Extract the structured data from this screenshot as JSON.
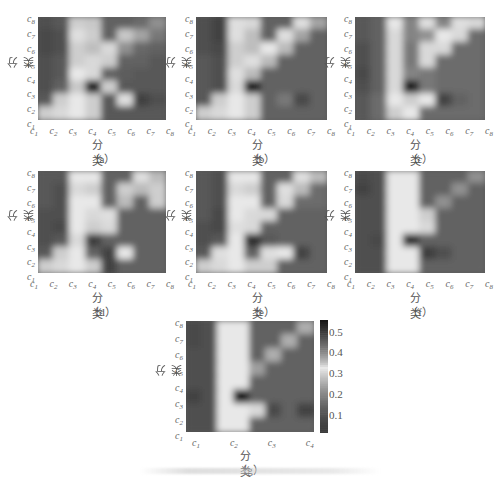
{
  "figure": {
    "axis_label": "分类",
    "colorbar": {
      "ticks": [
        "0.5",
        "0.4",
        "0.3",
        "0.2",
        "0.1"
      ],
      "tick_values": [
        0.5,
        0.4,
        0.3,
        0.2,
        0.1
      ],
      "range": [
        0.02,
        0.56
      ]
    }
  },
  "chart_data": [
    {
      "type": "heatmap",
      "panel": "a",
      "caption": "（a）",
      "xlabel": "分类",
      "ylabel": "分类",
      "x_ticks": [
        "c1",
        "c2",
        "c3",
        "c4",
        "c5",
        "c6",
        "c7",
        "c8"
      ],
      "y_ticks": [
        "c1",
        "c2",
        "c3",
        "c4",
        "c5",
        "c6",
        "c7",
        "c8"
      ],
      "values": [
        [
          0.1,
          0.12,
          0.3,
          0.35,
          0.14,
          0.14,
          0.16,
          0.4
        ],
        [
          0.08,
          0.1,
          0.32,
          0.3,
          0.14,
          0.35,
          0.38,
          0.18
        ],
        [
          0.08,
          0.1,
          0.3,
          0.28,
          0.34,
          0.4,
          0.15,
          0.14
        ],
        [
          0.1,
          0.12,
          0.3,
          0.34,
          0.3,
          0.14,
          0.14,
          0.12
        ],
        [
          0.1,
          0.12,
          0.33,
          0.34,
          0.14,
          0.13,
          0.12,
          0.12
        ],
        [
          0.1,
          0.14,
          0.35,
          0.55,
          0.3,
          0.12,
          0.12,
          0.12
        ],
        [
          0.12,
          0.3,
          0.33,
          0.3,
          0.12,
          0.32,
          0.05,
          0.1
        ],
        [
          0.3,
          0.34,
          0.33,
          0.3,
          0.12,
          0.12,
          0.12,
          0.12
        ]
      ]
    },
    {
      "type": "heatmap",
      "panel": "b",
      "caption": "（b）",
      "xlabel": "分类",
      "ylabel": "分类",
      "x_ticks": [
        "c1",
        "c2",
        "c3",
        "c4",
        "c5",
        "c6",
        "c7",
        "c8"
      ],
      "y_ticks": [
        "c1",
        "c2",
        "c3",
        "c4",
        "c5",
        "c6",
        "c7",
        "c8"
      ],
      "values": [
        [
          0.1,
          0.06,
          0.32,
          0.34,
          0.14,
          0.14,
          0.32,
          0.38
        ],
        [
          0.1,
          0.06,
          0.32,
          0.28,
          0.14,
          0.32,
          0.38,
          0.14
        ],
        [
          0.1,
          0.08,
          0.3,
          0.28,
          0.33,
          0.36,
          0.14,
          0.14
        ],
        [
          0.12,
          0.1,
          0.3,
          0.32,
          0.36,
          0.14,
          0.14,
          0.14
        ],
        [
          0.12,
          0.1,
          0.32,
          0.36,
          0.14,
          0.14,
          0.14,
          0.14
        ],
        [
          0.12,
          0.1,
          0.34,
          0.55,
          0.14,
          0.14,
          0.14,
          0.14
        ],
        [
          0.12,
          0.3,
          0.33,
          0.3,
          0.14,
          0.18,
          0.08,
          0.14
        ],
        [
          0.3,
          0.34,
          0.33,
          0.3,
          0.14,
          0.14,
          0.14,
          0.14
        ]
      ]
    },
    {
      "type": "heatmap",
      "panel": "c",
      "caption": "（c）",
      "xlabel": "分类",
      "ylabel": "分类",
      "x_ticks": [
        "c1",
        "c2",
        "c3",
        "c4",
        "c5",
        "c6",
        "c7",
        "c8"
      ],
      "y_ticks": [
        "c1",
        "c2",
        "c3",
        "c4",
        "c5",
        "c6",
        "c7",
        "c8"
      ],
      "values": [
        [
          0.12,
          0.14,
          0.33,
          0.2,
          0.32,
          0.2,
          0.32,
          0.34
        ],
        [
          0.12,
          0.14,
          0.34,
          0.2,
          0.22,
          0.33,
          0.34,
          0.16
        ],
        [
          0.1,
          0.14,
          0.34,
          0.18,
          0.34,
          0.34,
          0.16,
          0.16
        ],
        [
          0.1,
          0.14,
          0.34,
          0.18,
          0.34,
          0.16,
          0.16,
          0.16
        ],
        [
          0.08,
          0.14,
          0.34,
          0.2,
          0.18,
          0.16,
          0.16,
          0.16
        ],
        [
          0.1,
          0.14,
          0.34,
          0.55,
          0.18,
          0.16,
          0.16,
          0.16
        ],
        [
          0.12,
          0.16,
          0.33,
          0.3,
          0.33,
          0.06,
          0.14,
          0.16
        ],
        [
          0.12,
          0.16,
          0.3,
          0.33,
          0.16,
          0.16,
          0.16,
          0.16
        ]
      ]
    },
    {
      "type": "heatmap",
      "panel": "d",
      "caption": "（d）",
      "xlabel": "分类",
      "ylabel": "分类",
      "x_ticks": [
        "c1",
        "c2",
        "c3",
        "c4",
        "c5",
        "c6",
        "c7",
        "c8"
      ],
      "y_ticks": [
        "c1",
        "c2",
        "c3",
        "c4",
        "c5",
        "c6",
        "c7",
        "c8"
      ],
      "values": [
        [
          0.12,
          0.12,
          0.33,
          0.33,
          0.14,
          0.14,
          0.32,
          0.36
        ],
        [
          0.12,
          0.1,
          0.34,
          0.3,
          0.14,
          0.3,
          0.36,
          0.3
        ],
        [
          0.12,
          0.1,
          0.33,
          0.33,
          0.14,
          0.36,
          0.14,
          0.3
        ],
        [
          0.1,
          0.1,
          0.33,
          0.34,
          0.32,
          0.14,
          0.14,
          0.14
        ],
        [
          0.1,
          0.08,
          0.33,
          0.3,
          0.34,
          0.14,
          0.14,
          0.14
        ],
        [
          0.1,
          0.12,
          0.34,
          0.5,
          0.14,
          0.14,
          0.14,
          0.14
        ],
        [
          0.12,
          0.3,
          0.33,
          0.14,
          0.06,
          0.33,
          0.14,
          0.14
        ],
        [
          0.3,
          0.34,
          0.33,
          0.3,
          0.06,
          0.14,
          0.14,
          0.14
        ]
      ]
    },
    {
      "type": "heatmap",
      "panel": "e",
      "caption": "（e）",
      "xlabel": "分类",
      "ylabel": "分类",
      "x_ticks": [
        "c1",
        "c2",
        "c3",
        "c4",
        "c5",
        "c6",
        "c7",
        "c8"
      ],
      "y_ticks": [
        "c1",
        "c2",
        "c3",
        "c4",
        "c5",
        "c6",
        "c7",
        "c8"
      ],
      "values": [
        [
          0.12,
          0.1,
          0.33,
          0.33,
          0.14,
          0.14,
          0.32,
          0.36
        ],
        [
          0.12,
          0.1,
          0.34,
          0.3,
          0.14,
          0.32,
          0.36,
          0.16
        ],
        [
          0.12,
          0.1,
          0.33,
          0.33,
          0.14,
          0.34,
          0.16,
          0.16
        ],
        [
          0.12,
          0.08,
          0.33,
          0.34,
          0.34,
          0.14,
          0.14,
          0.14
        ],
        [
          0.1,
          0.08,
          0.32,
          0.34,
          0.14,
          0.14,
          0.14,
          0.14
        ],
        [
          0.1,
          0.12,
          0.33,
          0.52,
          0.12,
          0.14,
          0.14,
          0.14
        ],
        [
          0.12,
          0.32,
          0.33,
          0.14,
          0.32,
          0.33,
          0.06,
          0.14
        ],
        [
          0.3,
          0.34,
          0.33,
          0.3,
          0.3,
          0.14,
          0.14,
          0.14
        ]
      ]
    },
    {
      "type": "heatmap",
      "panel": "f",
      "caption": "（f）",
      "xlabel": "分类",
      "ylabel": "分类",
      "x_ticks": [
        "c1",
        "c2",
        "c3",
        "c4",
        "c5",
        "c6",
        "c7",
        "c8"
      ],
      "y_ticks": [
        "c1",
        "c2",
        "c3",
        "c4",
        "c5",
        "c6",
        "c7",
        "c8"
      ],
      "values": [
        [
          0.08,
          0.1,
          0.33,
          0.33,
          0.14,
          0.14,
          0.14,
          0.22
        ],
        [
          0.06,
          0.1,
          0.33,
          0.33,
          0.14,
          0.14,
          0.22,
          0.14
        ],
        [
          0.1,
          0.1,
          0.33,
          0.33,
          0.14,
          0.22,
          0.14,
          0.14
        ],
        [
          0.1,
          0.1,
          0.33,
          0.33,
          0.3,
          0.14,
          0.14,
          0.14
        ],
        [
          0.1,
          0.1,
          0.33,
          0.33,
          0.34,
          0.14,
          0.14,
          0.14
        ],
        [
          0.1,
          0.08,
          0.33,
          0.52,
          0.14,
          0.14,
          0.14,
          0.14
        ],
        [
          0.1,
          0.1,
          0.33,
          0.33,
          0.5,
          0.1,
          0.14,
          0.14
        ],
        [
          0.1,
          0.1,
          0.33,
          0.33,
          0.14,
          0.14,
          0.14,
          0.14
        ]
      ]
    },
    {
      "type": "heatmap",
      "panel": "g",
      "caption": "（g）",
      "xlabel": "分类",
      "ylabel": "分类",
      "x_ticks": [
        "c1",
        "c2",
        "c3",
        "c4"
      ],
      "y_ticks": [
        "c1",
        "c2",
        "c3",
        "c4",
        "c5",
        "c6",
        "c7",
        "c8"
      ],
      "colorbar": {
        "ticks": [
          0.1,
          0.2,
          0.3,
          0.4,
          0.5
        ],
        "range": [
          0.02,
          0.56
        ]
      },
      "values": [
        [
          0.08,
          0.1,
          0.33,
          0.33,
          0.14,
          0.14,
          0.14,
          0.26
        ],
        [
          0.08,
          0.1,
          0.33,
          0.33,
          0.14,
          0.14,
          0.26,
          0.14
        ],
        [
          0.1,
          0.1,
          0.33,
          0.33,
          0.14,
          0.26,
          0.14,
          0.14
        ],
        [
          0.1,
          0.1,
          0.33,
          0.33,
          0.24,
          0.14,
          0.14,
          0.14
        ],
        [
          0.1,
          0.1,
          0.33,
          0.33,
          0.14,
          0.14,
          0.14,
          0.14
        ],
        [
          0.06,
          0.1,
          0.33,
          0.55,
          0.14,
          0.14,
          0.14,
          0.14
        ],
        [
          0.1,
          0.1,
          0.33,
          0.33,
          0.34,
          0.08,
          0.14,
          0.06
        ],
        [
          0.1,
          0.1,
          0.33,
          0.33,
          0.14,
          0.14,
          0.14,
          0.14
        ]
      ]
    }
  ],
  "layout_labels": {
    "panels": [
      "a",
      "b",
      "c",
      "d",
      "e",
      "f",
      "g"
    ]
  }
}
